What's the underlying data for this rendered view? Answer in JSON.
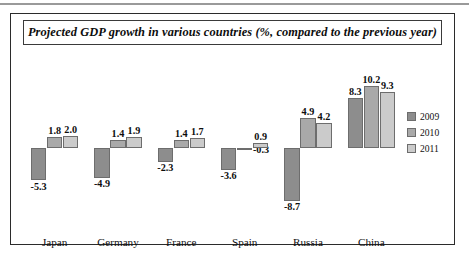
{
  "figure": {
    "title": "Projected GDP growth in various countries (%, compared to the previous year)"
  },
  "legend": {
    "position": "right",
    "entries": [
      {
        "label": "2009",
        "color": "#8d8d8d"
      },
      {
        "label": "2010",
        "color": "#a9a9a9"
      },
      {
        "label": "2011",
        "color": "#cbcbcb"
      }
    ]
  },
  "chart_data": {
    "type": "bar",
    "title": "Projected GDP growth in various countries (%, compared to the previous year)",
    "xlabel": "",
    "ylabel": "",
    "unit": "%",
    "grid": false,
    "legend_position": "right",
    "ylim": [
      -9.5,
      11.0
    ],
    "baseline": 0,
    "categories": [
      "Japan",
      "Germany",
      "France",
      "Spain",
      "Russia",
      "China"
    ],
    "series": [
      {
        "name": "2009",
        "color": "#8d8d8d",
        "values": [
          -5.3,
          -4.9,
          -2.3,
          -3.6,
          -8.7,
          8.3
        ]
      },
      {
        "name": "2010",
        "color": "#a9a9a9",
        "values": [
          1.8,
          1.4,
          1.4,
          -0.3,
          4.9,
          10.2
        ]
      },
      {
        "name": "2011",
        "color": "#cbcbcb",
        "values": [
          2.0,
          1.9,
          1.7,
          0.9,
          4.2,
          9.3
        ]
      }
    ],
    "data_labels": [
      {
        "category": "Japan",
        "series": "2009",
        "text": "-5.3"
      },
      {
        "category": "Japan",
        "series": "2010",
        "text": "1.8"
      },
      {
        "category": "Japan",
        "series": "2011",
        "text": "2.0"
      },
      {
        "category": "Germany",
        "series": "2009",
        "text": "-4.9"
      },
      {
        "category": "Germany",
        "series": "2010",
        "text": "1.4"
      },
      {
        "category": "Germany",
        "series": "2011",
        "text": "1.9"
      },
      {
        "category": "France",
        "series": "2009",
        "text": "-2.3"
      },
      {
        "category": "France",
        "series": "2010",
        "text": "1.4"
      },
      {
        "category": "France",
        "series": "2011",
        "text": "1.7"
      },
      {
        "category": "Spain",
        "series": "2009",
        "text": "-3.6"
      },
      {
        "category": "Spain",
        "series": "2010",
        "text": "-0.3"
      },
      {
        "category": "Spain",
        "series": "2011",
        "text": "0.9"
      },
      {
        "category": "Russia",
        "series": "2009",
        "text": "-8.7"
      },
      {
        "category": "Russia",
        "series": "2010",
        "text": "4.9"
      },
      {
        "category": "Russia",
        "series": "2011",
        "text": "4.2"
      },
      {
        "category": "China",
        "series": "2009",
        "text": "8.3"
      },
      {
        "category": "China",
        "series": "2010",
        "text": "10.2"
      },
      {
        "category": "China",
        "series": "2011",
        "text": "9.3"
      }
    ]
  }
}
